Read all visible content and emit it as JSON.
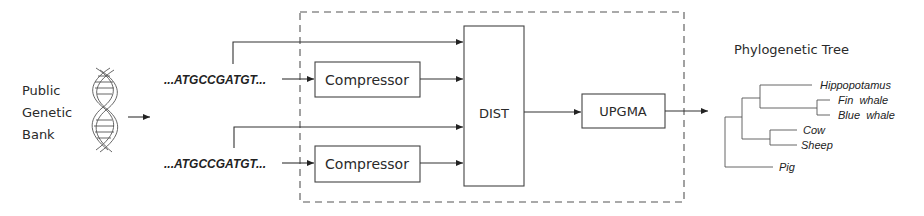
{
  "source": {
    "label_lines": [
      "Public",
      "Genetic",
      "Bank"
    ],
    "icon": "dna-helix-icon"
  },
  "sequences": [
    {
      "text": "...ATGCCGATGT..."
    },
    {
      "text": "...ATGCCGATGT..."
    }
  ],
  "blocks": {
    "compressor_top": "Compressor",
    "compressor_bottom": "Compressor",
    "dist": "DIST",
    "upgma": "UPGMA"
  },
  "tree": {
    "title": "Phylogenetic Tree",
    "leaves": [
      "Hippopotamus",
      "Fin  whale",
      "Blue  whale",
      "Cow",
      "Sheep",
      "Pig"
    ]
  }
}
